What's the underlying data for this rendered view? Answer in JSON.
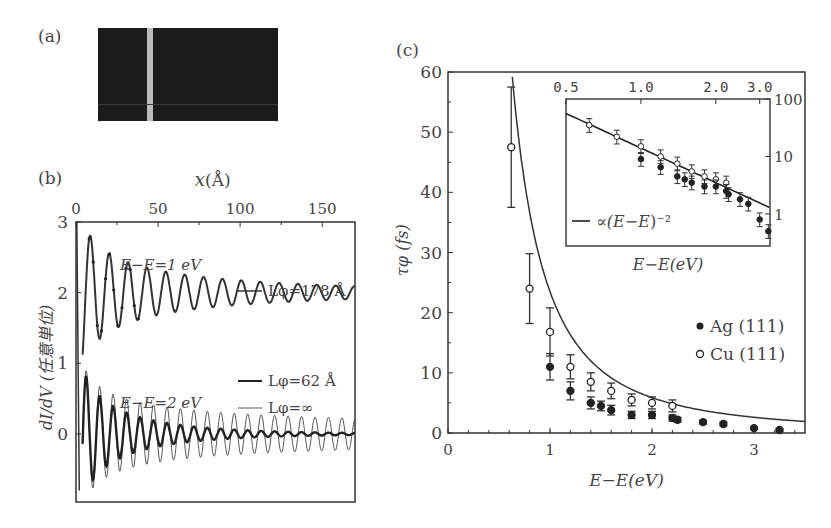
{
  "panels": {
    "a": {
      "label": "(a)"
    },
    "b": {
      "label": "(b)"
    },
    "c": {
      "label": "(c)"
    }
  },
  "chart_data": [
    {
      "id": "panel-a",
      "type": "image",
      "title": "(a)",
      "description": "STM topograph of surface with a single monatomic step edge (light vertical stripe)"
    },
    {
      "id": "panel-b",
      "type": "line",
      "title": "(b)",
      "xlabel": "x(Å)",
      "ylabel": "dI/dV (任意単位)",
      "xlim": [
        0,
        170
      ],
      "ylim": [
        -0.9,
        3
      ],
      "xticks": [
        0,
        50,
        100,
        150
      ],
      "yticks": [
        0,
        1,
        2,
        3
      ],
      "x_axis_position": "top",
      "annotations": [
        {
          "text": "E−E_F=1 eV",
          "x": 45,
          "y": 2.6
        },
        {
          "text": "E−E_F=2 eV",
          "x": 45,
          "y": 0.75
        }
      ],
      "series": [
        {
          "name": "L_φ=178 Å",
          "energy_eV": 1,
          "offset": 2,
          "style": "solid",
          "wavelength_A": 11.5,
          "amplitude_near_step": 1.0
        },
        {
          "name": "L_φ=62 Å",
          "energy_eV": 2,
          "offset": 0,
          "style": "solid-thick",
          "wavelength_A": 8.2,
          "amplitude_near_step": 1.0
        },
        {
          "name": "L_φ=∞",
          "energy_eV": 2,
          "offset": 0,
          "style": "thin",
          "wavelength_A": 8.2,
          "amplitude_near_step": 1.0
        }
      ],
      "legend": [
        "L_φ=178 Å",
        "L_φ=62 Å",
        "L_φ=∞"
      ]
    },
    {
      "id": "panel-c",
      "type": "scatter",
      "title": "(c)",
      "xlabel": "E−E_F(eV)",
      "ylabel": "τ_φ (fs)",
      "xlim": [
        0,
        3.5
      ],
      "ylim": [
        0,
        60
      ],
      "xticks": [
        0,
        1,
        2,
        3
      ],
      "yticks": [
        0,
        10,
        20,
        30,
        40,
        50,
        60
      ],
      "legend": [
        "Ag (111)",
        "Cu (111)"
      ],
      "legend_position": "lower right",
      "series": [
        {
          "name": "Cu (111)",
          "marker": "open-circle",
          "x": [
            0.62,
            0.8,
            1.0,
            1.2,
            1.4,
            1.6,
            1.8,
            2.0,
            2.2
          ],
          "y": [
            47.5,
            24,
            16.8,
            11,
            8.5,
            7,
            5.5,
            5,
            4.5
          ],
          "yerr": [
            10,
            5.8,
            4,
            2,
            1.5,
            1.3,
            1,
            1,
            1
          ]
        },
        {
          "name": "Ag (111)",
          "marker": "filled-circle",
          "x": [
            1.0,
            1.2,
            1.4,
            1.5,
            1.6,
            1.8,
            2.0,
            2.2,
            2.25,
            2.5,
            2.7,
            3.0,
            3.25
          ],
          "y": [
            11,
            7,
            5,
            4.5,
            3.8,
            3,
            3,
            2.5,
            2.2,
            1.8,
            1.5,
            0.8,
            0.5
          ],
          "yerr": [
            2.2,
            1.5,
            1,
            0.8,
            0.8,
            0.6,
            0.6,
            0.5,
            0.4,
            0.3,
            0.3,
            0.2,
            0.2
          ]
        },
        {
          "name": "∝(E−E_F)^-2 fit",
          "type": "line",
          "formula": "tau = 23.5 / (E-E_F)^2"
        }
      ],
      "inset": {
        "type": "scatter",
        "xscale": "log",
        "yscale": "log",
        "xlabel": "E−E_F(eV)",
        "xlim": [
          0.5,
          3.3
        ],
        "ylim": [
          0.3,
          100
        ],
        "xticks": [
          "0.5",
          "1.0",
          "2.0",
          "3.0"
        ],
        "yticks": [
          "1",
          "10",
          "100"
        ],
        "legend": [
          "∝(E−E_F)^-2"
        ]
      }
    }
  ]
}
